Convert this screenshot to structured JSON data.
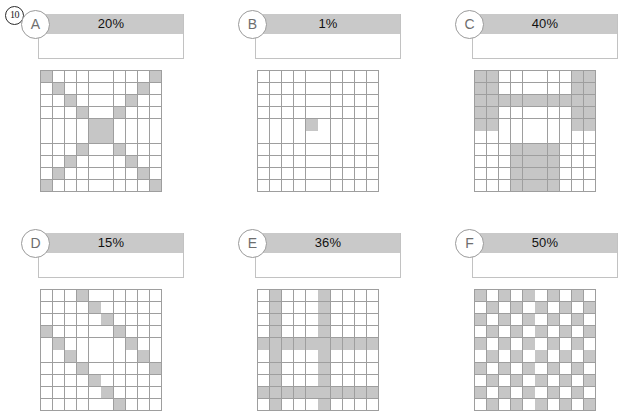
{
  "page": {
    "number": "10"
  },
  "legend": {
    "grid_size": 10,
    "filled_color": "#c6c6c6",
    "empty_color": "#ffffff",
    "gridline_color": "#9e9e9e",
    "header_bar_color": "#c9c9c9"
  },
  "panels": [
    {
      "id": "A",
      "letter": "A",
      "percent": "20%",
      "percent_value": 20,
      "pattern_name": "x-cross-diagonals",
      "filled_count": 20,
      "grid": [
        [
          1,
          0,
          0,
          0,
          0,
          0,
          0,
          0,
          0,
          1
        ],
        [
          0,
          1,
          0,
          0,
          0,
          0,
          0,
          0,
          1,
          0
        ],
        [
          0,
          0,
          1,
          0,
          0,
          0,
          0,
          1,
          0,
          0
        ],
        [
          0,
          0,
          0,
          1,
          0,
          0,
          1,
          0,
          0,
          0
        ],
        [
          0,
          0,
          0,
          0,
          1,
          1,
          0,
          0,
          0,
          0
        ],
        [
          0,
          0,
          0,
          0,
          1,
          1,
          0,
          0,
          0,
          0
        ],
        [
          0,
          0,
          0,
          1,
          0,
          0,
          1,
          0,
          0,
          0
        ],
        [
          0,
          0,
          1,
          0,
          0,
          0,
          0,
          1,
          0,
          0
        ],
        [
          0,
          1,
          0,
          0,
          0,
          0,
          0,
          0,
          1,
          0
        ],
        [
          1,
          0,
          0,
          0,
          0,
          0,
          0,
          0,
          0,
          1
        ]
      ]
    },
    {
      "id": "B",
      "letter": "B",
      "percent": "1%",
      "percent_value": 1,
      "pattern_name": "single-center-cell",
      "filled_count": 1,
      "grid": [
        [
          0,
          0,
          0,
          0,
          0,
          0,
          0,
          0,
          0,
          0
        ],
        [
          0,
          0,
          0,
          0,
          0,
          0,
          0,
          0,
          0,
          0
        ],
        [
          0,
          0,
          0,
          0,
          0,
          0,
          0,
          0,
          0,
          0
        ],
        [
          0,
          0,
          0,
          0,
          0,
          0,
          0,
          0,
          0,
          0
        ],
        [
          0,
          0,
          0,
          0,
          1,
          0,
          0,
          0,
          0,
          0
        ],
        [
          0,
          0,
          0,
          0,
          0,
          0,
          0,
          0,
          0,
          0
        ],
        [
          0,
          0,
          0,
          0,
          0,
          0,
          0,
          0,
          0,
          0
        ],
        [
          0,
          0,
          0,
          0,
          0,
          0,
          0,
          0,
          0,
          0
        ],
        [
          0,
          0,
          0,
          0,
          0,
          0,
          0,
          0,
          0,
          0
        ],
        [
          0,
          0,
          0,
          0,
          0,
          0,
          0,
          0,
          0,
          0
        ]
      ]
    },
    {
      "id": "C",
      "letter": "C",
      "percent": "40%",
      "percent_value": 40,
      "pattern_name": "bracket-and-block",
      "filled_count": 40,
      "grid": [
        [
          1,
          1,
          0,
          0,
          0,
          0,
          0,
          0,
          1,
          1
        ],
        [
          1,
          1,
          0,
          0,
          0,
          0,
          0,
          0,
          1,
          1
        ],
        [
          1,
          1,
          1,
          1,
          1,
          1,
          1,
          1,
          1,
          1
        ],
        [
          1,
          1,
          0,
          0,
          0,
          0,
          0,
          0,
          1,
          1
        ],
        [
          1,
          1,
          0,
          0,
          0,
          0,
          0,
          0,
          1,
          1
        ],
        [
          0,
          0,
          0,
          0,
          0,
          0,
          0,
          0,
          0,
          0
        ],
        [
          0,
          0,
          0,
          1,
          1,
          1,
          1,
          0,
          0,
          0
        ],
        [
          0,
          0,
          0,
          1,
          1,
          1,
          1,
          0,
          0,
          0
        ],
        [
          0,
          0,
          0,
          1,
          1,
          1,
          1,
          0,
          0,
          0
        ],
        [
          0,
          0,
          0,
          1,
          1,
          1,
          1,
          0,
          0,
          0
        ]
      ]
    },
    {
      "id": "D",
      "letter": "D",
      "percent": "15%",
      "percent_value": 15,
      "pattern_name": "parallel-diagonal-stripes",
      "filled_count": 15,
      "grid": [
        [
          0,
          0,
          0,
          1,
          0,
          0,
          0,
          0,
          0,
          0
        ],
        [
          0,
          0,
          0,
          0,
          1,
          0,
          0,
          0,
          0,
          0
        ],
        [
          0,
          0,
          0,
          0,
          0,
          1,
          0,
          0,
          0,
          0
        ],
        [
          1,
          0,
          0,
          0,
          0,
          0,
          1,
          0,
          0,
          0
        ],
        [
          0,
          1,
          0,
          0,
          0,
          0,
          0,
          1,
          0,
          0
        ],
        [
          0,
          0,
          1,
          0,
          0,
          0,
          0,
          0,
          1,
          0
        ],
        [
          0,
          0,
          0,
          1,
          0,
          0,
          0,
          0,
          0,
          1
        ],
        [
          0,
          0,
          0,
          0,
          1,
          0,
          0,
          0,
          0,
          0
        ],
        [
          0,
          0,
          0,
          0,
          0,
          1,
          0,
          0,
          0,
          0
        ],
        [
          0,
          0,
          0,
          0,
          0,
          0,
          1,
          0,
          0,
          0
        ]
      ]
    },
    {
      "id": "E",
      "letter": "E",
      "percent": "36%",
      "percent_value": 36,
      "pattern_name": "crossing-bands",
      "filled_count": 36,
      "grid": [
        [
          0,
          1,
          0,
          0,
          0,
          1,
          0,
          0,
          0,
          0
        ],
        [
          0,
          1,
          0,
          0,
          0,
          1,
          0,
          0,
          0,
          0
        ],
        [
          0,
          1,
          0,
          0,
          0,
          1,
          0,
          0,
          0,
          0
        ],
        [
          0,
          1,
          0,
          0,
          0,
          1,
          0,
          0,
          0,
          0
        ],
        [
          1,
          1,
          1,
          1,
          1,
          1,
          1,
          1,
          1,
          1
        ],
        [
          0,
          1,
          0,
          0,
          0,
          1,
          0,
          0,
          0,
          0
        ],
        [
          0,
          1,
          0,
          0,
          0,
          1,
          0,
          0,
          0,
          0
        ],
        [
          0,
          1,
          0,
          0,
          0,
          1,
          0,
          0,
          0,
          0
        ],
        [
          1,
          1,
          1,
          1,
          1,
          1,
          1,
          1,
          1,
          1
        ],
        [
          0,
          1,
          0,
          0,
          0,
          1,
          0,
          0,
          0,
          0
        ]
      ]
    },
    {
      "id": "F",
      "letter": "F",
      "percent": "50%",
      "percent_value": 50,
      "pattern_name": "checkerboard",
      "filled_count": 50,
      "grid": [
        [
          1,
          0,
          1,
          0,
          1,
          0,
          1,
          0,
          1,
          0
        ],
        [
          0,
          1,
          0,
          1,
          0,
          1,
          0,
          1,
          0,
          1
        ],
        [
          1,
          0,
          1,
          0,
          1,
          0,
          1,
          0,
          1,
          0
        ],
        [
          0,
          1,
          0,
          1,
          0,
          1,
          0,
          1,
          0,
          1
        ],
        [
          1,
          0,
          1,
          0,
          1,
          0,
          1,
          0,
          1,
          0
        ],
        [
          0,
          1,
          0,
          1,
          0,
          1,
          0,
          1,
          0,
          1
        ],
        [
          1,
          0,
          1,
          0,
          1,
          0,
          1,
          0,
          1,
          0
        ],
        [
          0,
          1,
          0,
          1,
          0,
          1,
          0,
          1,
          0,
          1
        ],
        [
          1,
          0,
          1,
          0,
          1,
          0,
          1,
          0,
          1,
          0
        ],
        [
          0,
          1,
          0,
          1,
          0,
          1,
          0,
          1,
          0,
          1
        ]
      ]
    }
  ]
}
